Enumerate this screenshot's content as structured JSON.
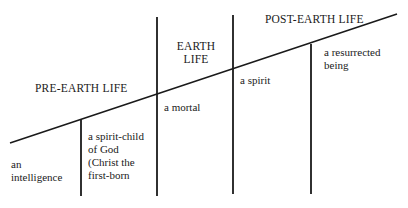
{
  "diagram": {
    "phases": [
      {
        "id": "pre-earth",
        "label": "PRE-EARTH LIFE"
      },
      {
        "id": "earth",
        "label_line1": "EARTH",
        "label_line2": "LIFE"
      },
      {
        "id": "post-earth",
        "label": "POST-EARTH LIFE"
      }
    ],
    "states": [
      {
        "id": "intelligence",
        "line1": "an",
        "line2": "intelligence"
      },
      {
        "id": "spirit-child",
        "line1": "a  spirit-child",
        "line2": "of  God",
        "line3": "(Christ  the",
        "line4": "first-born"
      },
      {
        "id": "mortal",
        "line1": "a  mortal"
      },
      {
        "id": "spirit",
        "line1": "a  spirit"
      },
      {
        "id": "resurrected",
        "line1": "a  resurrected",
        "line2": "being"
      }
    ],
    "colors": {
      "ink": "#1a1a1a",
      "background": "#ffffff"
    }
  }
}
